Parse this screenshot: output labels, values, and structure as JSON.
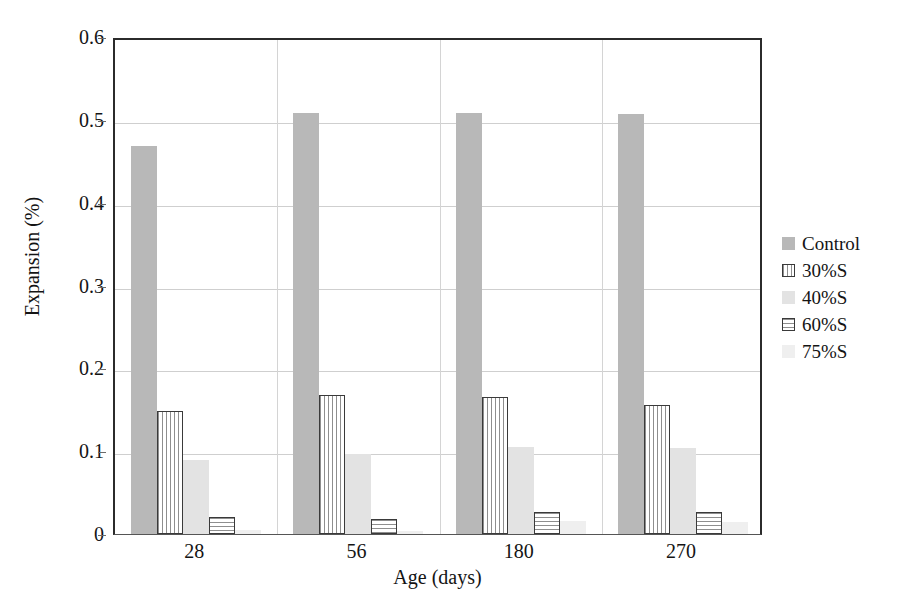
{
  "chart_data": {
    "type": "bar",
    "title": "",
    "xlabel": "Age (days)",
    "ylabel": "Expansion (%)",
    "categories": [
      "28",
      "56",
      "180",
      "270"
    ],
    "ylim": [
      0,
      0.6
    ],
    "ytick_labels": [
      "0",
      "0.1",
      "0.2",
      "0.3",
      "0.4",
      "0.5",
      "0.6"
    ],
    "ytick_values": [
      0,
      0.1,
      0.2,
      0.3,
      0.4,
      0.5,
      0.6
    ],
    "grid": "horizontal-and-vertical",
    "legend_position": "right",
    "series": [
      {
        "name": "Control",
        "swatch": "sw-control",
        "color": "#b8b8b8",
        "values": [
          0.468,
          0.508,
          0.508,
          0.507
        ]
      },
      {
        "name": "30%S",
        "swatch": "sw-30",
        "color": "#ffffff",
        "values": [
          0.149,
          0.168,
          0.166,
          0.156
        ]
      },
      {
        "name": "40%S",
        "swatch": "sw-40",
        "color": "#e3e3e3",
        "values": [
          0.089,
          0.097,
          0.105,
          0.104
        ]
      },
      {
        "name": "60%S",
        "swatch": "sw-60",
        "color": "#ffffff",
        "values": [
          0.02,
          0.018,
          0.027,
          0.027
        ]
      },
      {
        "name": "75%S",
        "swatch": "sw-75",
        "color": "#efefef",
        "values": [
          0.005,
          0.004,
          0.016,
          0.015
        ]
      }
    ]
  },
  "axis": {
    "y_title": "Expansion (%)",
    "x_title": "Age (days)"
  }
}
